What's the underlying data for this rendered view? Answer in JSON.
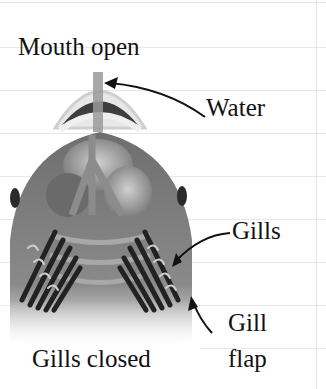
{
  "diagram": {
    "labels": {
      "mouth": "Mouth open",
      "water": "Water",
      "gills": "Gills",
      "gill_flap_line1": "Gill",
      "gill_flap_line2": "flap",
      "gills_closed": "Gills closed"
    },
    "colors": {
      "text": "#111111",
      "body": "#7a7a7a",
      "body_light": "#b5b5b5",
      "gill": "#2a2a2a",
      "arrow": "#111111"
    }
  }
}
